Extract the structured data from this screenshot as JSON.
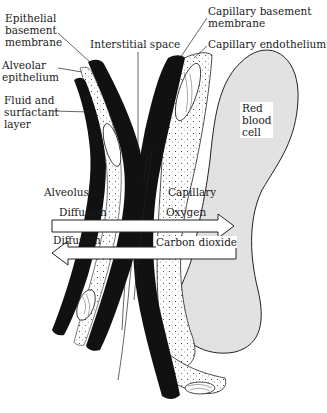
{
  "diagram": {
    "labels": {
      "epithelial_basement_membrane": [
        "Epithelial",
        "basement",
        "membrane"
      ],
      "alveolar_epithelium": [
        "Alveolar",
        "epithelium"
      ],
      "fluid_surfactant": [
        "Fluid and",
        "surfactant",
        "layer"
      ],
      "interstitial_space": "Interstitial space",
      "capillary_basement_membrane": [
        "Capillary basement",
        "membrane"
      ],
      "capillary_endothelium": "Capillary endothelium",
      "red_blood_cell": [
        "Red",
        "blood",
        "cell"
      ],
      "alveolus": "Alveolus",
      "capillary": "Capillary",
      "diffusion_top": "Diffusion",
      "oxygen": "Oxygen",
      "diffusion_bottom": "Diffusion",
      "carbon_dioxide": "Carbon dioxide"
    },
    "arrows": [
      {
        "name": "oxygen-arrow",
        "direction": "right",
        "label": "Oxygen"
      },
      {
        "name": "carbon-dioxide-arrow",
        "direction": "left",
        "label": "Carbon dioxide"
      }
    ],
    "colors": {
      "ink": "#111111",
      "rbc_fill": "#e2e2e2",
      "background": "#ffffff"
    }
  }
}
